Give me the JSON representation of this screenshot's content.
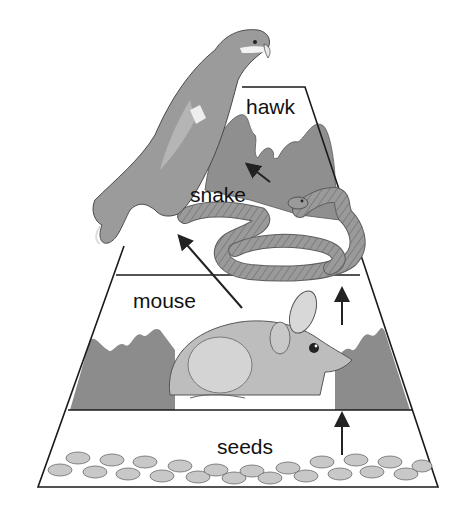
{
  "levels": [
    {
      "id": "hawk",
      "label": "hawk",
      "order": 4
    },
    {
      "id": "snake",
      "label": "snake",
      "order": 3
    },
    {
      "id": "mouse",
      "label": "mouse",
      "order": 2
    },
    {
      "id": "seeds",
      "label": "seeds",
      "order": 1
    }
  ],
  "arrows": [
    {
      "from": "seeds",
      "to": "mouse"
    },
    {
      "from": "mouse",
      "to": "snake"
    },
    {
      "from": "mouse",
      "to": "hawk"
    },
    {
      "from": "snake",
      "to": "hawk"
    }
  ],
  "colors": {
    "outline": "#1a1a1a",
    "fill_dark": "#8a8a8a",
    "fill_mid": "#a9a9a9",
    "fill_light": "#cfcfcf",
    "background": "#ffffff"
  }
}
